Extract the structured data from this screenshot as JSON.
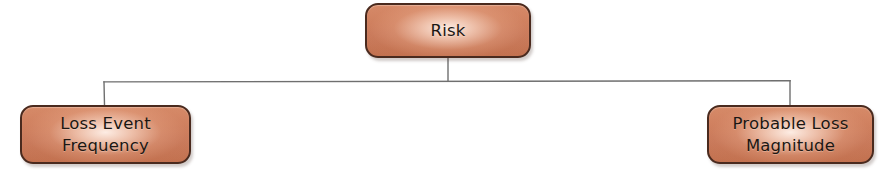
{
  "diagram": {
    "type": "tree",
    "canvas": {
      "width": 884,
      "height": 179,
      "background": "#ffffff"
    },
    "style": {
      "node_fill_top": "#d68a68",
      "node_fill_bottom": "#c2714f",
      "node_highlight": "#fff1e9",
      "node_border": "#4a2a1e",
      "label_color": "#1c1713",
      "connector_color": "#6f6f6f"
    },
    "nodes": [
      {
        "id": "risk",
        "label": "Risk",
        "level": 0,
        "x": 365,
        "y": 3,
        "width": 166,
        "height": 55,
        "center_x": 448
      },
      {
        "id": "loss-event-frequency",
        "label": "Loss Event\nFrequency",
        "level": 1,
        "x": 20,
        "y": 105,
        "width": 171,
        "height": 59,
        "center_x": 105
      },
      {
        "id": "probable-loss-magnitude",
        "label": "Probable Loss\nMagnitude",
        "level": 1,
        "x": 707,
        "y": 105,
        "width": 167,
        "height": 59,
        "center_x": 790
      }
    ],
    "edges": [
      {
        "from": "risk",
        "to": "loss-event-frequency",
        "style": "orthogonal"
      },
      {
        "from": "risk",
        "to": "probable-loss-magnitude",
        "style": "orthogonal"
      }
    ],
    "connector_geometry": {
      "trunk_x": 448,
      "trunk_top_y": 58,
      "bus_y": 81,
      "bus_left_x": 104,
      "bus_right_x": 790,
      "child_top_y": 105,
      "stroke_width": 1.4
    }
  }
}
